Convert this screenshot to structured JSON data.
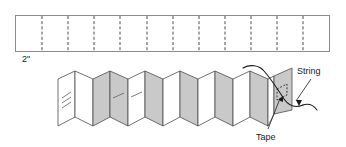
{
  "figure": {
    "strip": {
      "name": "paper-strip",
      "width_label": "2\"",
      "fold_count": 11,
      "description": "Rectangular paper strip with dashed fold lines"
    },
    "accordion": {
      "name": "folded-accordion",
      "panel_count": 14,
      "shading": [
        "white",
        "white",
        "gray",
        "gray",
        "white",
        "gray",
        "white",
        "gray",
        "white",
        "gray",
        "white",
        "gray",
        "white",
        "gray"
      ]
    },
    "labels": {
      "string": "String",
      "tape": "Tape",
      "dimension": "2\""
    },
    "colors": {
      "panel_gray": "#c9c9c9",
      "panel_white": "#ffffff",
      "line": "#4d4d4d",
      "strip_border": "#8c8c8c",
      "text": "#1a1a1a",
      "background": "#ffffff"
    }
  }
}
